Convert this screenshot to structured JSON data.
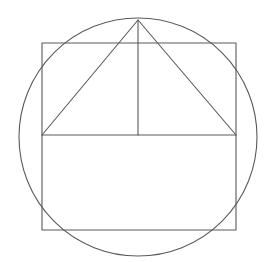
{
  "diagram": {
    "canvas": {
      "width": 270,
      "height": 262,
      "background": "#ffffff"
    },
    "stroke_color": "#5a5a5a",
    "stroke_width": 1.1,
    "circle": {
      "cx": 138,
      "cy": 137,
      "r": 119
    },
    "square": {
      "x": 42,
      "y": 43,
      "width": 194,
      "height": 187
    },
    "triangle": {
      "apex": {
        "x": 138,
        "y": 20
      },
      "base_left": {
        "x": 42,
        "y": 135
      },
      "base_right": {
        "x": 236,
        "y": 135
      }
    },
    "horizontal_line": {
      "x1": 42,
      "y1": 135,
      "x2": 236,
      "y2": 135
    },
    "vertical_line": {
      "x1": 138,
      "y1": 20,
      "x2": 138,
      "y2": 135
    }
  }
}
